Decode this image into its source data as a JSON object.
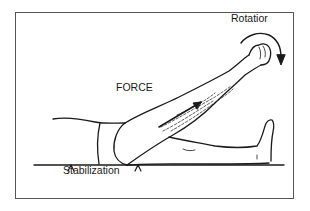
{
  "figure": {
    "labels": {
      "rotation": "Rotatior",
      "force": "FORCE",
      "stabilization": "Stabilization"
    },
    "colors": {
      "line": "#1a1a1a",
      "frame": "#555555",
      "background": "#ffffff"
    },
    "icons": {
      "rotation_arrow": "curved-arrow-clockwise",
      "force_arrow": "straight-arrow-up-right",
      "stabilization_markers": "caret-up"
    }
  }
}
